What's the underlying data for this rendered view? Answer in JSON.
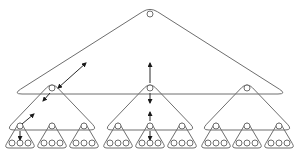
{
  "diagram": {
    "type": "nested-tree-of-triangles",
    "levels": 4,
    "colors": {
      "stroke": "#6e6e6e",
      "arrow": "#1a1a1a",
      "background": "#ffffff"
    },
    "root": {
      "x": 150,
      "y": 14
    },
    "top_triangle": {
      "apex": [
        150,
        7
      ],
      "left": [
        13,
        94
      ],
      "right": [
        287,
        94
      ]
    },
    "level2_nodes": [
      {
        "x": 52,
        "y": 88
      },
      {
        "x": 150,
        "y": 88
      },
      {
        "x": 247,
        "y": 88
      }
    ],
    "level3_nodes": [
      {
        "x": 20,
        "y": 126
      },
      {
        "x": 52,
        "y": 126
      },
      {
        "x": 84,
        "y": 126
      },
      {
        "x": 118,
        "y": 126
      },
      {
        "x": 150,
        "y": 126
      },
      {
        "x": 182,
        "y": 126
      },
      {
        "x": 216,
        "y": 126
      },
      {
        "x": 247,
        "y": 126
      },
      {
        "x": 279,
        "y": 126
      }
    ],
    "leaves_per_group": 3,
    "arrows": [
      {
        "from": [
          58,
          88
        ],
        "to": [
          86,
          63
        ],
        "direction": "bidirectional-diagonal"
      },
      {
        "from": [
          22,
          124
        ],
        "to": [
          34,
          114
        ],
        "direction": "diagonal-up"
      },
      {
        "from": [
          20,
          131
        ],
        "to": [
          20,
          140
        ],
        "direction": "down"
      },
      {
        "from": [
          150,
          83
        ],
        "to": [
          150,
          63
        ],
        "direction": "up"
      },
      {
        "from": [
          150,
          93
        ],
        "to": [
          150,
          103
        ],
        "direction": "down"
      },
      {
        "from": [
          150,
          121
        ],
        "to": [
          150,
          112
        ],
        "direction": "up"
      },
      {
        "from": [
          150,
          131
        ],
        "to": [
          150,
          140
        ],
        "direction": "down"
      }
    ]
  }
}
